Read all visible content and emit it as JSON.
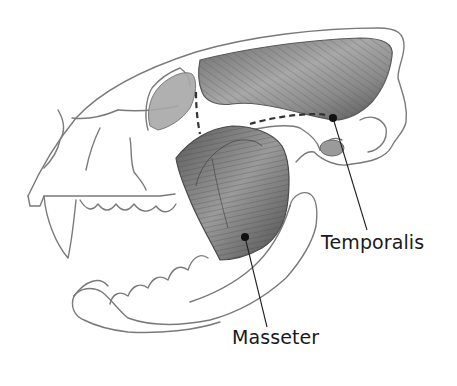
{
  "diagram": {
    "labels": [
      {
        "id": "temporalis",
        "text": "Temporalis",
        "pointer": {
          "dot": [
            333,
            118
          ],
          "text_anchor": [
            367,
            228
          ]
        }
      },
      {
        "id": "masseter",
        "text": "Masseter",
        "pointer": {
          "dot": [
            245,
            237
          ],
          "text_anchor": [
            267,
            327
          ]
        }
      }
    ],
    "muscles": [
      {
        "name": "Temporalis",
        "color": "#6e6e6e",
        "region": "upper skull, behind orbit"
      },
      {
        "name": "Masseter",
        "color": "#5e5e5e",
        "region": "cheek, over jaw hinge"
      }
    ],
    "colors": {
      "outline": "#7a7a7a",
      "muscle_dark": "#555555",
      "muscle_light": "#b8b8b8",
      "text": "#1a1a1a",
      "background": "#ffffff"
    }
  }
}
